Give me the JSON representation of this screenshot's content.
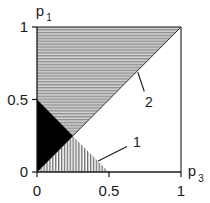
{
  "figure": {
    "type": "region-diagram",
    "background": "#ffffff",
    "line_color": "#1a1a1a"
  },
  "axes": {
    "x": {
      "label": "p",
      "label_subscript": "3",
      "min": 0,
      "max": 1,
      "ticks": [
        {
          "value": 0,
          "label": "0"
        },
        {
          "value": 0.5,
          "label": "0.5"
        },
        {
          "value": 1,
          "label": "1"
        }
      ]
    },
    "y": {
      "label": "p",
      "label_subscript": "1",
      "min": 0,
      "max": 1,
      "ticks": [
        {
          "value": 0,
          "label": "0"
        },
        {
          "value": 0.5,
          "label": "0.5"
        },
        {
          "value": 1,
          "label": "1"
        }
      ]
    }
  },
  "regions": [
    {
      "id": "region-2",
      "name": "upper-triangle-horizontal-hatch",
      "fill_style": "horizontal-hatch",
      "fill_color": "#9a9a9a",
      "polygon": [
        [
          0,
          0
        ],
        [
          0,
          1
        ],
        [
          1,
          1
        ]
      ]
    },
    {
      "id": "region-black",
      "name": "black-triangle",
      "fill_style": "solid",
      "fill_color": "#000000",
      "polygon": [
        [
          0,
          0
        ],
        [
          0,
          0.5
        ],
        [
          0.25,
          0.25
        ]
      ]
    },
    {
      "id": "region-1",
      "name": "lower-triangle-vertical-hatch",
      "fill_style": "vertical-hatch",
      "fill_color": "#8a8a8a",
      "polygon": [
        [
          0,
          0
        ],
        [
          0.25,
          0.25
        ],
        [
          0.5,
          0
        ]
      ]
    }
  ],
  "annotations": [
    {
      "id": "label-2",
      "text": "2",
      "text_x": 0.78,
      "text_y": 0.46,
      "leader_from_x": 0.745,
      "leader_from_y": 0.555,
      "leader_to_x": 0.7,
      "leader_to_y": 0.685
    },
    {
      "id": "label-1",
      "text": "1",
      "text_x": 0.655,
      "text_y": 0.195,
      "leader_from_x": 0.625,
      "leader_from_y": 0.175,
      "leader_to_x": 0.425,
      "leader_to_y": 0.075
    }
  ]
}
